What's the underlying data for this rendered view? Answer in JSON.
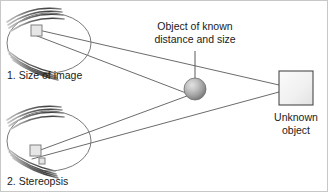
{
  "figure": {
    "type": "diagram",
    "title_visible": false,
    "background_color": "#ffffff",
    "border_color": "#c8c8c8",
    "width": 328,
    "height": 192
  },
  "labels": {
    "eye1": "1. Size of image",
    "eye2": "2. Stereopsis",
    "known_object_line1": "Object of known",
    "known_object_line2": "distance and size",
    "unknown_object_line1": "Unknown",
    "unknown_object_line2": "object"
  },
  "colors": {
    "line": "#5a5a5a",
    "eye_outline": "#7a7a7a",
    "lash_dark": "#4a4a4a",
    "lash_light": "#b5b5b5",
    "retina_square_fill": "#e6e6e6",
    "retina_square_stroke": "#808080",
    "sphere_light": "#d9d9d9",
    "sphere_mid": "#a8a8a8",
    "sphere_dark": "#7d7d7d",
    "unknown_square_fill": "#f2f2f2",
    "unknown_square_stroke": "#4a4a4a",
    "text": "#1a1a1a"
  },
  "geometry": {
    "eye1": {
      "cx": 48,
      "cy": 42,
      "rx": 42,
      "ry": 30,
      "nodal_x": 78,
      "nodal_y": 45
    },
    "eye2": {
      "cx": 48,
      "cy": 140,
      "rx": 42,
      "ry": 30,
      "nodal_x": 78,
      "nodal_y": 144
    },
    "known_object_sphere": {
      "cx": 194,
      "cy": 88,
      "r": 11
    },
    "unknown_object_square": {
      "x": 278,
      "y": 70,
      "w": 34,
      "h": 34
    },
    "leader_line": {
      "x": 194,
      "y_top": 52,
      "y_bottom": 78
    }
  },
  "elements": {
    "eye1_retina_image": "small-square-on-retina",
    "eye2_retina_images": [
      "small-square-upper",
      "small-square-lower"
    ],
    "ray_count_eye1": 2,
    "ray_count_eye2": 2
  }
}
